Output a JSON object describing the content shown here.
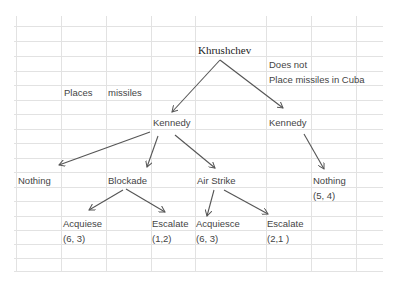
{
  "diagram": {
    "type": "game-tree",
    "root": {
      "player": "Khrushchev",
      "moves": [
        {
          "label": "Places missiles",
          "node": {
            "player": "Kennedy",
            "moves": [
              {
                "label": "Nothing"
              },
              {
                "label": "Blockade",
                "children": [
                  {
                    "label": "Acquiese",
                    "payoff": "(6, 3)"
                  },
                  {
                    "label": "Escalate",
                    "payoff": "(1,2)"
                  }
                ]
              },
              {
                "label": "Air Strike",
                "children": [
                  {
                    "label": "Acquiesce",
                    "payoff": "(6, 3)"
                  },
                  {
                    "label": "Escalate",
                    "payoff": "(2,1 )"
                  }
                ]
              }
            ]
          }
        },
        {
          "label": "Does not Place missiles in Cuba",
          "node": {
            "player": "Kennedy",
            "moves": [
              {
                "label": "Nothing",
                "payoff": "(5, 4)"
              }
            ]
          }
        }
      ]
    }
  },
  "labels": {
    "khrushchev": "Khrushchev",
    "places": "Places",
    "missiles": "missiles",
    "does_not": "Does not",
    "place_missiles_cuba": "Place missiles in Cuba",
    "kennedy_left": "Kennedy",
    "kennedy_right": "Kennedy",
    "nothing_left": "Nothing",
    "blockade": "Blockade",
    "air_strike": "Air Strike",
    "nothing_right": "Nothing",
    "payoff_nothing_right": "(5, 4)",
    "acquiese": "Acquiese",
    "payoff_acquiese": "(6, 3)",
    "escalate_blockade": "Escalate",
    "payoff_escalate_blockade": "(1,2)",
    "acquiesce": "Acquiesce",
    "payoff_acquiesce": "(6, 3)",
    "escalate_airstrike": "Escalate",
    "payoff_escalate_airstrike": "(2,1 )"
  },
  "colors": {
    "grid": "#e2e2e2",
    "edge": "#555555",
    "text": "#444444"
  }
}
